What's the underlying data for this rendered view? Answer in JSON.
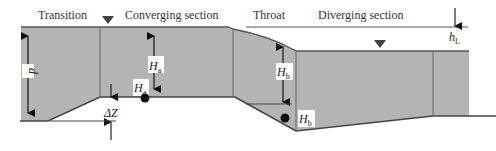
{
  "diagram": {
    "type": "flume-longitudinal-section",
    "colors": {
      "water_fill": "#b4b4b4",
      "line": "#555555",
      "arrow": "#111111",
      "label_bg": "#ffffff"
    },
    "section_labels": {
      "transition": "Transition",
      "converging": "Converging section",
      "throat": "Throat",
      "diverging": "Diverging section"
    },
    "symbols": {
      "d": "d",
      "Ha_main": "H",
      "Ha_main_sub": "a",
      "Ha_point": "H",
      "Ha_point_sub": "a",
      "Hb_main": "H",
      "Hb_main_sub": "b",
      "Hb_point": "H",
      "Hb_point_sub": "b",
      "deltaZ": "ΔZ",
      "hL": "h",
      "hL_sub": "L"
    }
  }
}
